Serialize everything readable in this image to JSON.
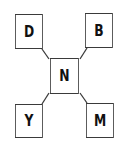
{
  "diagram": {
    "center": {
      "label": "N"
    },
    "nodes": [
      {
        "label": "D",
        "position": "top-left"
      },
      {
        "label": "B",
        "position": "top-right"
      },
      {
        "label": "Y",
        "position": "bottom-left"
      },
      {
        "label": "M",
        "position": "bottom-right"
      }
    ]
  }
}
